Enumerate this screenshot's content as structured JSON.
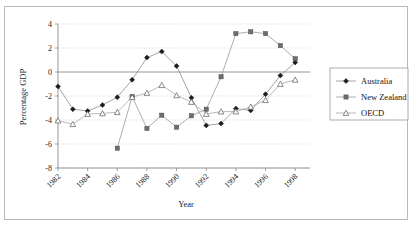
{
  "figure": {
    "background_color": "#ffffff",
    "frame_color": "#b9b9b9",
    "grid_color": "#c9c9c9",
    "axis_color": "#8a8a8a"
  },
  "chart_data": {
    "type": "line",
    "title": "",
    "xlabel": "Year",
    "ylabel": "Percentage GDP",
    "xlim": [
      1982,
      1999
    ],
    "ylim": [
      -8,
      4
    ],
    "yticks": [
      4,
      2,
      0,
      -2,
      -4,
      -6,
      -8
    ],
    "xticks": [
      1982,
      1984,
      1986,
      1988,
      1990,
      1992,
      1994,
      1996,
      1998
    ],
    "grid": "horizontal-dotted",
    "legend_position": "right-outside",
    "x": [
      1982,
      1983,
      1984,
      1985,
      1986,
      1987,
      1988,
      1989,
      1990,
      1991,
      1992,
      1993,
      1994,
      1995,
      1996,
      1997,
      1998
    ],
    "series": [
      {
        "name": "Australia",
        "marker": "filled-diamond",
        "color": "#1c1c1c",
        "values": [
          -1.2,
          -3.1,
          -3.25,
          -2.75,
          -2.1,
          -0.65,
          1.2,
          1.7,
          0.5,
          -2.15,
          -4.45,
          -4.3,
          -3.05,
          -3.2,
          -1.85,
          -0.3,
          0.8
        ]
      },
      {
        "name": "New Zealand",
        "marker": "filled-square",
        "color": "#6e6e6e",
        "values": [
          null,
          null,
          null,
          null,
          -6.35,
          -2.05,
          -4.7,
          -3.6,
          -4.6,
          -3.65,
          -3.1,
          -0.4,
          3.2,
          3.35,
          3.2,
          2.2,
          1.1
        ]
      },
      {
        "name": "OECD",
        "marker": "open-triangle",
        "color": "#5a5a5a",
        "values": [
          -4.05,
          -4.35,
          -3.5,
          -3.45,
          -3.35,
          -2.1,
          -1.75,
          -1.1,
          -1.95,
          -2.5,
          -3.5,
          -3.3,
          -3.3,
          -2.9,
          -2.35,
          -1.0,
          -0.65
        ]
      }
    ]
  },
  "legend": {
    "entries": [
      {
        "label": "Australia",
        "marker": "filled-diamond"
      },
      {
        "label": "New Zealand",
        "marker": "filled-square"
      },
      {
        "label": "OECD",
        "marker": "open-triangle"
      }
    ]
  },
  "axis_text": {
    "y_tick_labels": [
      "4",
      "2",
      "0",
      "-2",
      "-4",
      "-6",
      "-8"
    ],
    "x_tick_labels": [
      "1982",
      "1984",
      "1986",
      "1988",
      "1990",
      "1992",
      "1994",
      "1996",
      "1998"
    ],
    "y_axis_title": "Percentage GDP",
    "x_axis_title": "Year"
  }
}
